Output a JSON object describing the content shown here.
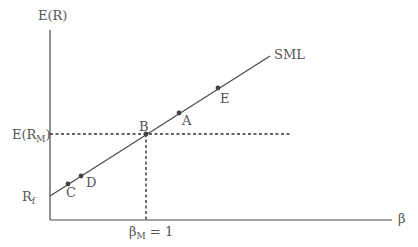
{
  "diagram": {
    "colors": {
      "line": "#4a4a4a",
      "text": "#555555",
      "point": "#444444",
      "background": "#ffffff"
    },
    "y_axis": {
      "label": "E(R)"
    },
    "x_axis": {
      "label": "β"
    },
    "sml_label": "SML",
    "market_return_label": {
      "main": "E(R",
      "sub": "M",
      "close": ")"
    },
    "risk_free_label": {
      "main": "R",
      "sub": "f"
    },
    "market_beta_label": {
      "main": "β",
      "sub": "M",
      "rest": " = 1"
    },
    "points": [
      {
        "name": "A",
        "x": 179,
        "y": 113
      },
      {
        "name": "B",
        "x": 146,
        "y": 134
      },
      {
        "name": "C",
        "x": 68,
        "y": 184
      },
      {
        "name": "D",
        "x": 81,
        "y": 176
      },
      {
        "name": "E",
        "x": 218,
        "y": 88
      }
    ]
  }
}
